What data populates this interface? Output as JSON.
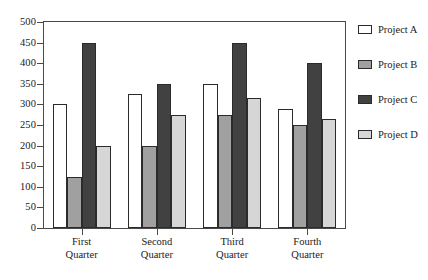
{
  "chart_data": {
    "type": "bar",
    "title": "",
    "xlabel": "",
    "ylabel": "",
    "ylim": [
      0,
      500
    ],
    "ytick_step": 50,
    "grid": false,
    "legend_position": "right",
    "categories": [
      "First Quarter",
      "Second Quarter",
      "Third Quarter",
      "Fourth Quarter"
    ],
    "category_lines": [
      [
        "First",
        "Quarter"
      ],
      [
        "Second",
        "Quarter"
      ],
      [
        "Third",
        "Quarter"
      ],
      [
        "Fourth",
        "Quarter"
      ]
    ],
    "ytick_labels": [
      "0",
      "50",
      "100",
      "150",
      "200",
      "250",
      "300",
      "350",
      "400",
      "450",
      "500"
    ],
    "ytick_values": [
      0,
      50,
      100,
      150,
      200,
      250,
      300,
      350,
      400,
      450,
      500
    ],
    "series": [
      {
        "name": "Project A",
        "color": "#ffffff",
        "values": [
          300,
          325,
          350,
          290
        ]
      },
      {
        "name": "Project B",
        "color": "#a0a0a0",
        "values": [
          125,
          200,
          275,
          250
        ]
      },
      {
        "name": "Project C",
        "color": "#414141",
        "values": [
          450,
          350,
          450,
          400
        ]
      },
      {
        "name": "Project D",
        "color": "#d6d6d6",
        "values": [
          200,
          275,
          315,
          265
        ]
      }
    ]
  },
  "legend": {
    "items": [
      {
        "label": "Project A",
        "color": "#ffffff"
      },
      {
        "label": "Project B",
        "color": "#a0a0a0"
      },
      {
        "label": "Project C",
        "color": "#414141"
      },
      {
        "label": "Project D",
        "color": "#d6d6d6"
      }
    ]
  },
  "colors": {
    "axis": "#4a4a4a",
    "bar_outline": "#2b2b2b",
    "text": "#1a1a1a",
    "background": "#ffffff"
  }
}
